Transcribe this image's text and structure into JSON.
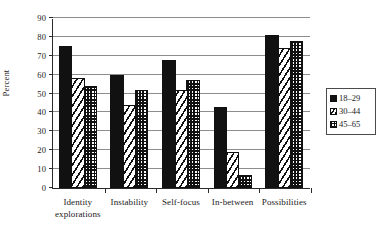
{
  "chart_data": {
    "type": "bar",
    "title": "",
    "xlabel": "",
    "ylabel": "Percent",
    "ylim": [
      0,
      90
    ],
    "ytick_step": 10,
    "yticks": [
      0,
      10,
      20,
      30,
      40,
      50,
      60,
      70,
      80,
      90
    ],
    "ytick_labels": [
      "0",
      "10",
      "20",
      "30",
      "40",
      "50",
      "60",
      "70",
      "80",
      "90"
    ],
    "grid": true,
    "legend_position": "right",
    "categories": [
      "Identity explorations",
      "Instability",
      "Self-focus",
      "In-between",
      "Possibilities"
    ],
    "category_lines": [
      [
        "Identity",
        "explorations"
      ],
      [
        "Instability"
      ],
      [
        "Self-focus"
      ],
      [
        "In-between"
      ],
      [
        "Possibilities"
      ]
    ],
    "series": [
      {
        "name": "18–29",
        "pattern": "solid-black",
        "color": "#111111",
        "values": [
          75,
          60,
          68,
          43,
          81
        ]
      },
      {
        "name": "30–44",
        "pattern": "diagonal-hatch",
        "color": "#ffffff",
        "values": [
          58,
          44,
          52,
          19,
          74
        ]
      },
      {
        "name": "45–65",
        "pattern": "checkerboard",
        "color": "#ffffff",
        "values": [
          54,
          52,
          57,
          7,
          78
        ]
      }
    ]
  },
  "legend": {
    "entries": [
      {
        "label": "18–29"
      },
      {
        "label": "30–44"
      },
      {
        "label": "45–65"
      }
    ]
  }
}
